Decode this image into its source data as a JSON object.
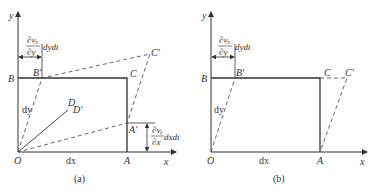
{
  "panels": [
    {
      "caption": "(a)",
      "axes": {
        "x": "x",
        "y": "y"
      },
      "points": {
        "O": "O",
        "A": "A",
        "B": "B",
        "C": "C",
        "Ap": "A′",
        "Bp": "B′",
        "Cp": "C′",
        "D": "D",
        "Dp": "D′"
      },
      "dims": {
        "dx": "dx",
        "dy": "dy"
      },
      "annotations": {
        "top_num": "∂vₓ",
        "top_den": "∂y",
        "top_tail": "dydt",
        "right_num": "∂vᵧ",
        "right_den": "∂x",
        "right_tail": "dxdt"
      }
    },
    {
      "caption": "(b)",
      "axes": {
        "x": "x",
        "y": "y"
      },
      "points": {
        "O": "O",
        "A": "A",
        "B": "B",
        "C": "C",
        "Bp": "B′",
        "Cp": "C′"
      },
      "dims": {
        "dx": "dx",
        "dy": "dy"
      },
      "annotations": {
        "top_num": "∂vₓ",
        "top_den": "∂y",
        "top_tail": "dydt"
      }
    }
  ],
  "colors": {
    "line": "#333333",
    "dashed": "#555555"
  }
}
